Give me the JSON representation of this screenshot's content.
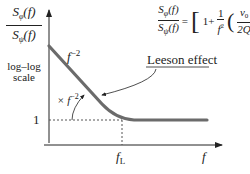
{
  "y_axis": {
    "numerator": "S",
    "numerator_sub": "φ",
    "numerator_arg": "(f)",
    "denominator": "S",
    "denominator_sub": "ψ",
    "denominator_arg": "(f)",
    "scale_line1": "log–log",
    "scale_line2": "scale",
    "tick_one": "1"
  },
  "x_axis": {
    "label": "f",
    "corner_label": "f",
    "corner_sub": "L"
  },
  "curve_labels": {
    "slope": "f",
    "slope_exp": "−2",
    "leeson": "Leeson effect",
    "times": "× f",
    "times_exp": "−2"
  },
  "equation": {
    "lhs_num": "S",
    "lhs_num_sub": "φ",
    "lhs_num_arg": "(f)",
    "lhs_den": "S",
    "lhs_den_sub": "ψ",
    "lhs_den_arg": "(f)",
    "equals": "=",
    "one_plus": "1+",
    "frac_num": "1",
    "frac_den": "f",
    "frac_den_exp": "2",
    "nu": "ν",
    "nu_sub": "0",
    "two_q": "2Q",
    "outer_exp": "2"
  },
  "colors": {
    "curve": "#6b6b6b",
    "axis": "#222222",
    "dotted": "#555555"
  }
}
